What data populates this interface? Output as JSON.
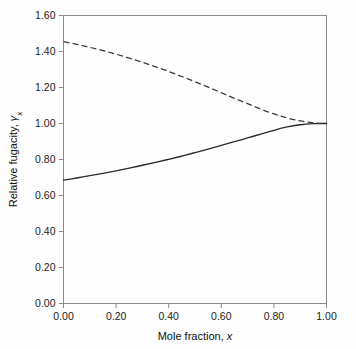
{
  "chart_data": {
    "type": "line",
    "title": "",
    "subtitle": "",
    "xlabel": "Mole fraction, x",
    "xlabel_plain": "Mole fraction,",
    "xlabel_italic": "x",
    "ylabel": "Relative fugacity, γx",
    "ylabel_plain": "Relative fugacity,",
    "ylabel_symbol": "γ",
    "ylabel_subscript": "x",
    "xlim": [
      0.0,
      1.0
    ],
    "ylim": [
      0.0,
      1.6
    ],
    "xticks": [
      0.0,
      0.2,
      0.4,
      0.6,
      0.8,
      1.0
    ],
    "yticks": [
      0.0,
      0.2,
      0.4,
      0.6,
      0.8,
      1.0,
      1.2,
      1.4,
      1.6
    ],
    "xtick_labels": [
      "0.00",
      "0.20",
      "0.40",
      "0.60",
      "0.80",
      "1.00"
    ],
    "ytick_labels": [
      "0.00",
      "0.20",
      "0.40",
      "0.60",
      "0.80",
      "1.00",
      "1.20",
      "1.40",
      "1.60"
    ],
    "grid": false,
    "legend": false,
    "legend_position": "none",
    "tick_direction": "out",
    "frame": "box",
    "background_color": "#ffffff",
    "series": [
      {
        "name": "solid-curve",
        "style": "solid",
        "color": "#2b2b2b",
        "x": [
          0.0,
          0.05,
          0.1,
          0.15,
          0.2,
          0.25,
          0.3,
          0.35,
          0.4,
          0.45,
          0.5,
          0.55,
          0.6,
          0.65,
          0.7,
          0.75,
          0.8,
          0.85,
          0.9,
          0.95,
          1.0
        ],
        "values": [
          0.685,
          0.697,
          0.71,
          0.723,
          0.737,
          0.752,
          0.768,
          0.784,
          0.801,
          0.819,
          0.838,
          0.858,
          0.878,
          0.899,
          0.92,
          0.941,
          0.962,
          0.981,
          0.993,
          0.999,
          1.0
        ]
      },
      {
        "name": "dashed-curve",
        "style": "dashed",
        "color": "#3a3a3a",
        "x": [
          0.0,
          0.05,
          0.1,
          0.15,
          0.2,
          0.25,
          0.3,
          0.35,
          0.4,
          0.45,
          0.5,
          0.55,
          0.6,
          0.65,
          0.7,
          0.75,
          0.8,
          0.85,
          0.9,
          0.95,
          1.0
        ],
        "values": [
          1.455,
          1.44,
          1.423,
          1.405,
          1.385,
          1.363,
          1.34,
          1.315,
          1.289,
          1.261,
          1.232,
          1.202,
          1.171,
          1.14,
          1.11,
          1.08,
          1.053,
          1.031,
          1.014,
          1.004,
          1.0
        ]
      }
    ]
  }
}
